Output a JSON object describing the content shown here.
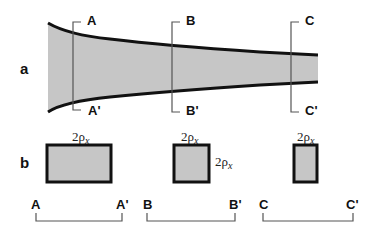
{
  "figure": {
    "panels": [
      {
        "id": "a",
        "label": "a"
      },
      {
        "id": "b",
        "label": "b"
      }
    ],
    "sections": [
      {
        "top": "A",
        "bottom": "A'"
      },
      {
        "top": "B",
        "bottom": "B'"
      },
      {
        "top": "C",
        "bottom": "C'"
      }
    ],
    "cross_sections": [
      {
        "width_label": "2ρ",
        "width_sub": "x",
        "height_label": ""
      },
      {
        "width_label": "2ρ",
        "width_sub": "x",
        "height_label": "2ρ",
        "height_sub": "x"
      },
      {
        "width_label": "2ρ",
        "width_sub": "x",
        "height_label": ""
      }
    ],
    "scales": [
      {
        "left": "A",
        "right": "A'"
      },
      {
        "left": "B",
        "right": "B'"
      },
      {
        "left": "C",
        "right": "C'"
      }
    ],
    "colors": {
      "fill": "#c6c6c6",
      "outline": "#111111",
      "bracket": "#555555"
    }
  }
}
